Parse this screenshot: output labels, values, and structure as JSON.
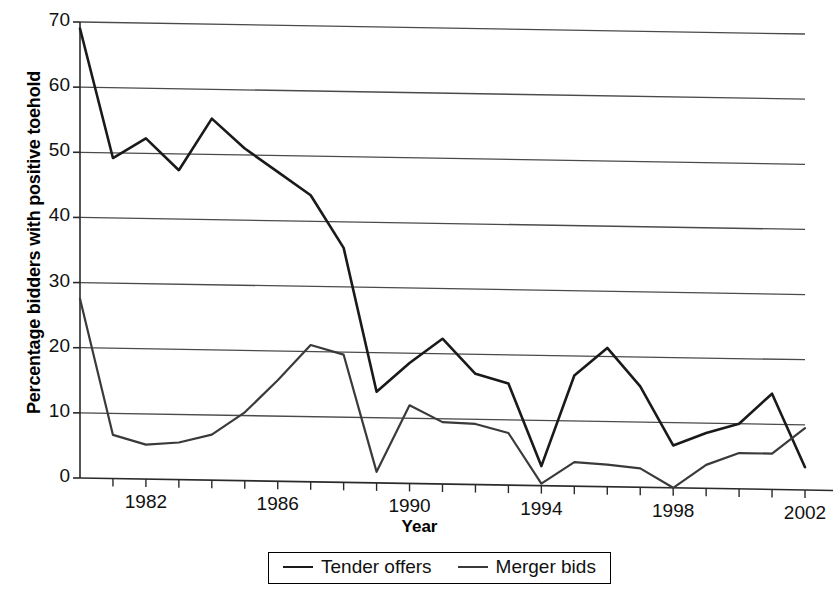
{
  "chart_data": {
    "type": "line",
    "title": "",
    "xlabel": "Year",
    "ylabel": "Percentage bidders with positive toehold",
    "xlim": [
      1980,
      2002
    ],
    "ylim": [
      0,
      70
    ],
    "ytick_values": [
      0,
      10,
      20,
      30,
      40,
      50,
      60,
      70
    ],
    "xtick_labels": [
      "1982",
      "1986",
      "1990",
      "1994",
      "1998",
      "2002"
    ],
    "xtick_label_values": [
      1982,
      1986,
      1990,
      1994,
      1998,
      2002
    ],
    "grid": "horizontal",
    "legend_position": "below",
    "x": [
      1980,
      1981,
      1982,
      1983,
      1984,
      1985,
      1986,
      1987,
      1988,
      1989,
      1990,
      1991,
      1992,
      1993,
      1994,
      1995,
      1996,
      1997,
      1998,
      1999,
      2000,
      2001,
      2002
    ],
    "series": [
      {
        "name": "Tender offers",
        "color": "#1a1a1a",
        "values": [
          69.0,
          49.2,
          52.3,
          47.5,
          55.5,
          51.0,
          47.5,
          44.0,
          36.0,
          14.0,
          18.5,
          22.3,
          17.0,
          15.6,
          3.0,
          17.0,
          21.3,
          15.5,
          6.5,
          8.5,
          10.0,
          14.7,
          3.5
        ]
      },
      {
        "name": "Merger bids",
        "color": "#3a3a3a",
        "values": [
          27.5,
          6.7,
          5.3,
          5.7,
          7.0,
          10.5,
          15.5,
          21.0,
          19.6,
          1.7,
          12.0,
          9.5,
          9.3,
          8.0,
          0.3,
          3.7,
          3.4,
          2.9,
          0.0,
          3.6,
          5.5,
          5.5,
          9.5
        ]
      }
    ]
  },
  "legend": {
    "items": [
      {
        "label": "Tender offers"
      },
      {
        "label": "Merger bids"
      }
    ]
  }
}
